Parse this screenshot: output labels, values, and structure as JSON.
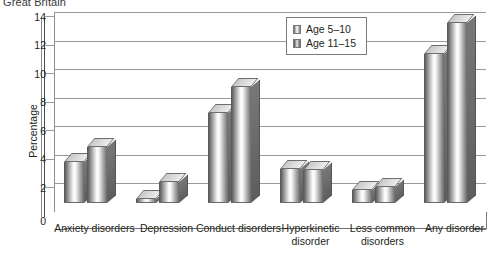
{
  "title": "Great Britain",
  "legend": {
    "position": "top-right",
    "items": [
      {
        "label": "Age 5–10",
        "icon": "bar-swatch-icon"
      },
      {
        "label": "Age 11–15",
        "icon": "bar-swatch-icon"
      }
    ]
  },
  "axes": {
    "ylabel": "Percentage",
    "yticks": [
      "0",
      "2",
      "4",
      "6",
      "8",
      "10",
      "12",
      "14"
    ]
  },
  "chart_data": {
    "type": "bar",
    "title": "Great Britain",
    "xlabel": "",
    "ylabel": "Percentage",
    "ylim": [
      0,
      14
    ],
    "ytick_step": 2,
    "grid": true,
    "legend_position": "top-right",
    "style": "3d-grouped-bar",
    "categories": [
      "Anxiety disorders",
      "Depression",
      "Conduct disorders",
      "Hyperkinetic disorder",
      "Less common disorders",
      "Any disorder"
    ],
    "series": [
      {
        "name": "Age 5–10",
        "values": [
          2.9,
          0.3,
          6.3,
          2.4,
          0.9,
          10.4
        ]
      },
      {
        "name": "Age 11–15",
        "values": [
          3.9,
          1.5,
          8.1,
          2.3,
          1.1,
          12.6
        ]
      }
    ]
  }
}
